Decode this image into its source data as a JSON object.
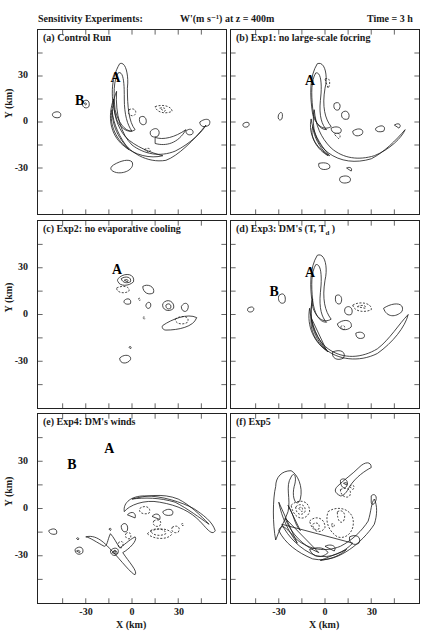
{
  "header": {
    "left": "Sensitivity Experiments:",
    "middle": "W'(m s⁻¹) at z = 400m",
    "right": "Time = 3 h"
  },
  "axes": {
    "ylabel": "Y (km)",
    "xlabel": "X (km)",
    "yticks": [
      "30",
      "0",
      "-30"
    ],
    "xticks": [
      "-30",
      "0",
      "30"
    ]
  },
  "panels": [
    {
      "id": "a",
      "label": "(a) Control Run"
    },
    {
      "id": "b",
      "label": "(b) Exp1: no large-scale focring"
    },
    {
      "id": "c",
      "label": "(c) Exp2: no evaporative cooling"
    },
    {
      "id": "d",
      "label": "(d) Exp3: DM's (T, T",
      "label_sub": "d",
      "label_end": " )"
    },
    {
      "id": "e",
      "label": "(e) Exp4: DM's winds"
    },
    {
      "id": "f",
      "label": "(f) Exp5"
    }
  ],
  "chart_data": {
    "type": "contour",
    "xlabel": "X (km)",
    "ylabel": "Y (km)",
    "xlim": [
      -60,
      60
    ],
    "ylim": [
      -60,
      60
    ],
    "xticks": [
      -30,
      0,
      30
    ],
    "yticks": [
      -30,
      0,
      30
    ],
    "grid": false,
    "layout": "3 rows x 2 columns",
    "panels": [
      {
        "label": "(a) Control Run",
        "annotations": [
          {
            "text": "A",
            "x": -10,
            "y": 25
          },
          {
            "text": "B",
            "x": -30,
            "y": 12
          }
        ],
        "feature": "curved crescent updraft band from (-5,35) arcing through (-8,0) to (45,5)"
      },
      {
        "label": "(b) Exp1: no large-scale focring",
        "annotations": [
          {
            "text": "A",
            "x": -10,
            "y": 25
          }
        ],
        "feature": "crescent band similar to control, no B cell"
      },
      {
        "label": "(c) Exp2: no evaporative cooling",
        "annotations": [
          {
            "text": "A",
            "x": -10,
            "y": 25
          }
        ],
        "feature": "scattered weak isolated cells only"
      },
      {
        "label": "(d) Exp3: DM's (T, Td)",
        "annotations": [
          {
            "text": "A",
            "x": -10,
            "y": 25
          },
          {
            "text": "B",
            "x": -30,
            "y": 14
          }
        ],
        "feature": "crescent band similar to control"
      },
      {
        "label": "(e) Exp4: DM's winds",
        "annotations": [
          {
            "text": "A",
            "x": -15,
            "y": 32
          },
          {
            "text": "B",
            "x": -37,
            "y": 25
          }
        ],
        "feature": "elongated cross-shaped cell near A, weak arc to the southeast"
      },
      {
        "label": "(f) Exp5",
        "annotations": [],
        "feature": "circular ring of convection centered near origin, radius ~30 km"
      }
    ]
  },
  "contours": {
    "a": {
      "solid": [
        "M-8,-38 C-4,-40 -2,-30 -3,-22 C-3,-10 -2,0 2,5 C-2,8 -8,4 -10,-2 C-14,-15 -14,-28 -8,-38 Z",
        "M-9,-32 C-5,-34 -5,-22 -5,-15 C-5,-5 -3,2 0,6 C-5,6 -9,0 -11,-8 C-12,-18 -12,-27 -9,-32 Z",
        "M-10,-20 C-14,-10 -14,0 -8,10 C-2,20 10,27 22,25 C30,22 40,12 48,2 C46,6 38,14 28,19 C18,23 8,21 0,15 C-7,8 -11,-5 -10,-20 Z",
        "M-12,-15 C-16,-3 -14,8 -6,15 C2,22 12,24 20,22 C12,20 2,16 -4,10 C-10,3 -12,-6 -12,-15 Z",
        "M-13,-8 C-15,2 -10,12 -2,18 C-8,10 -12,2 -13,-8 Z",
        "M-12,28 C-7,25 -2,24 0,26 C2,30 -4,34 -10,33 C-14,32 -15,30 -12,28 Z",
        "M5,-3 C8,-5 10,-2 9,1 C7,3 4,1 5,-3 Z",
        "M12,6 C16,2 19,6 17,9 C14,11 11,9 12,6 Z",
        "M15,10 C20,12 28,10 35,5 C30,14 22,16 15,14 Z",
        "M-32,-13 C-29,-16 -27,-13 -28,-10 C-30,-8 -33,-10 -32,-13 Z",
        "M-31,-12 C-30,-13 -29,-12 -30,-11 Z",
        "M-51,-6 C-47,-8 -45,-5 -47,-3 C-50,-2 -53,-4 -51,-6 Z",
        "M35,6 C38,3 41,6 39,8 C37,9 35,8 35,6 Z",
        "M44,0 C48,-3 52,-2 50,2 C47,4 44,3 44,0 Z"
      ],
      "dashed": [
        "M15,-10 C20,-12 26,-10 26,-7 C22,-5 16,-6 15,-10 Z",
        "M18,-9 C21,-10 23,-8 21,-7 Z",
        "M-2,-8 C2,-10 4,-6 1,-4 C-2,-4 -3,-6 -2,-8 Z",
        "M8,18 C11,16 13,18 11,20 Z"
      ]
    },
    "b": {
      "solid": [
        "M-5,-38 C0,-40 2,-30 0,-22 C-2,-10 0,-2 4,3 C-1,6 -6,2 -8,-5 C-10,-18 -10,-30 -5,-38 Z",
        "M-6,-32 C-2,-33 -2,-22 -3,-14 C-4,-4 -2,2 1,5 C-4,5 -7,-1 -8,-9 C-9,-19 -9,-27 -6,-32 Z",
        "M-7,-8 C-9,4 -6,14 2,20 C10,26 20,27 30,24 C38,20 46,12 52,5 C50,10 42,18 32,22 C22,25 12,24 4,17 C-3,10 -6,2 -7,-8 Z",
        "M-9,-2 C-11,8 -6,17 3,22 C-4,14 -8,6 -9,-2 Z",
        "M-8,3 C-10,10 -5,18 2,22 C-4,16 -7,10 -8,3 Z",
        "M6,-12 C9,-14 11,-11 9,-8 C7,-7 5,-9 6,-12 Z",
        "M11,-6 C14,-9 17,-5 15,-2 C12,-1 10,-3 11,-6 Z",
        "M-4,27 C0,26 4,27 3,30 C0,32 -5,31 -4,27 Z",
        "M4,4 C8,2 12,4 10,7 C7,8 4,7 4,4 Z",
        "M18,6 C22,3 26,5 24,8 C21,10 18,9 18,6 Z",
        "M33,4 C37,1 40,3 38,6 C35,7 32,6 33,4 Z",
        "M45,2 C48,0 50,2 48,4 Z",
        "M-30,-5 C-28,-8 -27,-5 -28,-2 C-30,0 -31,-3 -30,-5 Z",
        "M-53,1 C-50,-1 -48,1 -50,3 C-52,4 -54,3 -53,1 Z",
        "M10,36 C14,34 18,36 16,39 C12,41 8,39 10,36 Z",
        "M14,30 C16,29 18,30 17,32 Z"
      ],
      "dashed": [
        "M0,-28 C3,-30 4,-25 2,-22 Z",
        "M6,8 C9,6 11,9 9,11 Z"
      ]
    },
    "c": {
      "solid": [
        "M-8,-24 C-4,-27 2,-26 1,-21 C-2,-18 -8,-18 -9,-21 C-10,-22 -9,-23 -8,-24 Z",
        "M-7,-23 C-4,-25 0,-24 -1,-21 C-3,-20 -6,-20 -7,-23 Z",
        "M-5,-22 C-3,-23 -2,-22 -3,-21 Z",
        "M7,-18 C10,-20 15,-18 14,-14 C11,-12 7,-14 7,-18 Z",
        "M-5,-9 C-3,-11 0,-10 -1,-7 C-3,-6 -6,-7 -5,-9 Z",
        "M9,-6 C10,-9 13,-8 12,-5 C11,-3 9,-4 9,-6 Z",
        "M20,-7 C23,-11 28,-8 27,-4 C24,-1 19,-3 20,-7 Z",
        "M22,-6 C24,-8 26,-6 25,-4 C23,-3 22,-4 22,-6 Z",
        "M32,-5 C34,-9 38,-7 36,-3 C35,-1 32,-2 32,-5 Z",
        "M20,7 C26,3 36,-1 42,2 C40,8 30,10 22,10 C20,10 19,8 20,7 Z",
        "M-8,28 C-5,25 0,26 -1,29 C-3,32 -8,32 -8,28 Z",
        "M-2,21 C-1,20 0,21 -1,22 Z"
      ],
      "dashed": [
        "M-10,-17 C-6,-19 -1,-18 -2,-15 C-5,-13 -10,-14 -10,-17 Z",
        "M28,3 C32,0 38,1 36,5 C33,7 28,6 28,3 Z",
        "M4,-10 C5,-11 6,-10 5,-9 Z",
        "M7,2 C8,1 9,2 8,3 Z"
      ]
    },
    "d": {
      "solid": [
        "M-5,-38 C0,-40 2,-30 0,-22 C-2,-10 0,-2 4,3 C-1,6 -6,2 -8,-5 C-10,-18 -10,-30 -5,-38 Z",
        "M-6,-32 C-2,-33 -2,-22 -3,-14 C-4,-4 -2,2 1,5 C-4,5 -7,-1 -8,-9 C-9,-19 -9,-27 -6,-32 Z",
        "M-8,-10 C-11,3 -7,15 2,22 C12,29 24,28 34,22 C42,16 48,6 54,0 C52,8 44,18 34,25 C22,31 8,29 0,22 C-8,14 -11,2 -8,-10 Z",
        "M-10,-4 C-12,8 -7,18 2,24 C-5,16 -9,6 -10,-4 Z",
        "M-9,2 C-10,10 -6,18 1,23 Z",
        "M7,-12 C10,-14 12,-10 10,-7 C8,-6 6,-8 7,-12 Z",
        "M13,-4 C16,-7 19,-3 17,0 C14,1 12,-1 13,-4 Z",
        "M8,6 C13,2 18,4 17,8 C14,11 9,10 8,6 Z",
        "M20,12 C24,10 27,13 25,15 C22,16 20,15 20,12 Z",
        "M38,-4 C44,-8 52,-8 50,-2 C46,2 40,2 38,-4 Z",
        "M5,24 C10,22 14,24 12,28 C8,30 4,28 5,24 Z",
        "M-30,-12 C-27,-15 -25,-12 -26,-8 C-28,-6 -31,-8 -30,-12 Z",
        "M-50,-4 C-47,-6 -45,-4 -47,-2 C-49,-1 -51,-2 -50,-4 Z"
      ],
      "dashed": [
        "M18,-6 C23,-9 31,-7 30,-3 C25,-1 19,-2 18,-6 Z",
        "M21,-5 C24,-7 28,-5 26,-4 Z",
        "M10,8 C12,6 14,8 12,10 Z"
      ]
    },
    "e": {
      "solid": [
        "M-30,18 C-22,16 -16,24 -12,28 C-8,32 0,42 2,42 C4,40 -2,34 -6,28 C-2,26 4,20 2,18 C-2,20 -6,24 -8,25 C-10,22 -12,18 -14,16 C-16,20 -16,24 -18,24 C-22,22 -28,18 -30,18 Z",
        "M-14,27 C-12,24 -8,25 -9,28 C-10,31 -14,30 -14,27 Z",
        "M-13,28 C-11,26 -9,27 -10,29 Z",
        "M-12,27 C-11,26 -10,27 -11,28 Z",
        "M-7,11 C-5,8 -2,10 -3,14 C-5,16 -7,14 -7,11 Z",
        "M-37,26 C-34,23 -31,25 -32,28 C-34,30 -37,29 -37,26 Z",
        "M-36,27 C-35,26 -33,27 -34,28 Z",
        "M-54,14 C-51,12 -48,13 -49,16 C-51,17 -54,16 -54,14 Z",
        "M-36,19 C-35,18 -34,19 -35,20 Z",
        "M-15,13 C-14,12 -13,13 -14,14 Z",
        "M-5,2 C-2,-2 8,-6 18,-4 C30,-2 38,2 44,8 C48,12 52,18 54,14 C52,8 46,4 40,0 C32,-4 20,-8 8,-8 C0,-8 -6,-4 -5,2 Z",
        "M0,-6 C8,-8 20,-10 30,-6 C38,-2 44,4 50,10 C44,6 36,0 28,-4 C18,-7 8,-7 0,-6 Z",
        "M-3,4 C0,1 3,3 2,6 Z",
        "M20,2 C24,-1 28,1 26,4 C23,5 20,4 20,2 Z",
        "M13,5 C16,2 19,4 18,7 Z"
      ],
      "dashed": [
        "M-9,22 C-7,20 -5,21 -6,24 C-7,26 -9,25 -9,22 Z",
        "M-4,16 C-2,14 0,16 -1,19 C-3,20 -5,18 -4,16 Z",
        "M10,16 C14,12 24,12 26,16 C24,20 14,20 10,16 Z",
        "M12,14 C16,12 22,13 22,16 C18,18 13,17 12,14 Z",
        "M14,8 C17,6 20,8 18,11 C16,12 13,11 14,8 Z",
        "M26,12 C29,10 32,12 30,15 C28,16 25,15 26,12 Z",
        "M5,0 C9,-3 13,0 11,3 C8,4 4,3 5,0 Z",
        "M32,10 C33,9 34,10 33,11 Z"
      ]
    },
    "f": {
      "solid": [
        "M-32,20 C-30,14 -26,8 -24,2 C-22,-6 -26,-14 -22,-20 C-20,-24 -18,-20 -20,-14 C-22,-6 -18,0 -16,-6 C-14,-14 -18,-22 -22,-24 C-28,-24 -32,-20 -32,-14 C-34,-6 -34,10 -32,20 Z",
        "M-30,14 C-26,22 -18,28 -8,32 C2,34 10,30 16,26 C22,22 28,16 32,10 C34,4 34,-2 32,-6 C30,-4 30,2 28,8 C24,14 18,20 10,24 C0,28 -10,26 -18,20 C-24,14 -28,8 -30,14 Z",
        "M-28,10 C-24,18 -16,26 -6,30 C4,32 12,28 18,22 Z",
        "M-26,6 C-22,16 -14,24 -4,28 Z",
        "M-30,-4 C-28,6 -24,14 -18,22 Z",
        "M-24,-2 C-20,4 -20,10 -16,14 Z",
        "M-3,33 C4,32 10,30 14,26 C10,28 4,30 -3,33 Z",
        "M-10,26 C-4,24 0,25 2,28 C-2,32 -8,31 -10,26 Z",
        "M8,-14 C12,-18 18,-22 22,-26 C26,-30 30,-30 30,-26 C26,-24 20,-20 16,-14 C14,-10 12,-8 10,-8 C6,-10 6,-12 8,-14 Z",
        "M10,-18 C12,-20 16,-18 14,-14 C12,-12 10,-14 10,-18 Z",
        "M12,-16 C14,-17 15,-16 14,-15 Z",
        "M30,-8 C32,-10 34,-8 33,-5 C32,-2 30,-2 30,-4 Z",
        "M16,18 C20,16 24,18 22,22 C19,24 15,22 16,18 Z",
        "M0,24 C4,22 8,24 6,27 Z"
      ],
      "dashed": [
        "M-22,-2 C-18,-6 -10,-6 -10,2 C-12,8 -20,8 -22,-2 Z",
        "M-19,-1 C-16,-4 -12,-2 -13,2 C-15,5 -19,4 -19,-1 Z",
        "M-17,0 C-15,-2 -14,0 -15,2 Z",
        "M-10,8 C-6,4 0,6 0,12 C-2,16 -8,16 -10,8 Z",
        "M-8,10 C-5,8 -3,10 -4,13 C-6,14 -8,13 -8,10 Z",
        "M2,2 C8,-2 16,0 18,6 C20,14 14,20 8,18 C2,14 0,8 2,2 Z",
        "M8,2 C12,0 14,4 12,8 C10,10 8,8 8,2 Z",
        "M10,-12 C14,-14 18,-12 16,-8 C14,-6 10,-8 10,-12 Z",
        "M16,-14 C18,-16 20,-14 18,-12 Z",
        "M4,10 C6,9 7,11 5,12 Z"
      ]
    }
  },
  "annotations": {
    "a": [
      {
        "t": "A",
        "x": -14,
        "y": -26
      },
      {
        "t": "B",
        "x": -37,
        "y": -11
      }
    ],
    "b": [
      {
        "t": "A",
        "x": -13,
        "y": -24
      }
    ],
    "c": [
      {
        "t": "A",
        "x": -13,
        "y": -26
      }
    ],
    "d": [
      {
        "t": "A",
        "x": -13,
        "y": -24
      },
      {
        "t": "B",
        "x": -36,
        "y": -12
      }
    ],
    "e": [
      {
        "t": "A",
        "x": -18,
        "y": -35
      },
      {
        "t": "B",
        "x": -42,
        "y": -25
      }
    ],
    "f": []
  }
}
